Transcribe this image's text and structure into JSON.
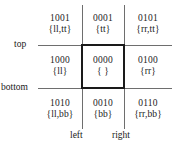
{
  "diagram": {
    "type": "four-bit-region-code-grid",
    "axis_labels": {
      "top": "top",
      "bottom": "bottom",
      "left": "left",
      "right": "right"
    },
    "highlight_color": "#1a1a1a",
    "grid_line_color": "#6e6e6e",
    "cells": [
      {
        "code": "1001",
        "set": "{ll,tt}"
      },
      {
        "code": "0001",
        "set": "{tt}"
      },
      {
        "code": "0101",
        "set": "{rr,tt}"
      },
      {
        "code": "1000",
        "set": "{ll}"
      },
      {
        "code": "0000",
        "set": "{ }"
      },
      {
        "code": "0100",
        "set": "{rr}"
      },
      {
        "code": "1010",
        "set": "{ll,bb}"
      },
      {
        "code": "0010",
        "set": "{bb}"
      },
      {
        "code": "0110",
        "set": "{rr,bb}"
      }
    ]
  }
}
